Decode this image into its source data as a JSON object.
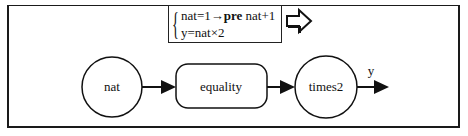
{
  "diagram": {
    "rule_box": {
      "line1": {
        "lhs": "nat=1",
        "arrow": "→",
        "keyword": "pre",
        "rhs": " nat+1"
      },
      "line2": "y=nat×2"
    },
    "transition_icon": "outline-right-arrow-icon",
    "nodes": [
      {
        "id": "nat",
        "label": "nat",
        "shape": "circle"
      },
      {
        "id": "equality",
        "label": "equality",
        "shape": "rounded-rect"
      },
      {
        "id": "times2",
        "label": "times2",
        "shape": "circle"
      }
    ],
    "edges": [
      {
        "from": "nat",
        "to": "equality",
        "label": ""
      },
      {
        "from": "equality",
        "to": "times2",
        "label": ""
      },
      {
        "from": "times2",
        "to": "output",
        "label": "y"
      }
    ],
    "colors": {
      "stroke": "#111111",
      "background": "#ffffff"
    }
  }
}
